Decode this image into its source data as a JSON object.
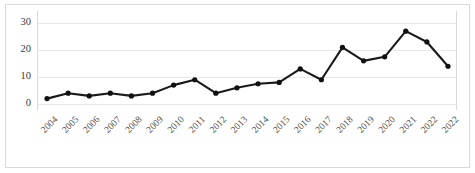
{
  "chart_data": {
    "type": "line",
    "title": "",
    "subtitle": "",
    "xlabel": "",
    "ylabel": "",
    "categories": [
      "2004",
      "2005",
      "2006",
      "2007",
      "2008",
      "2009",
      "2010",
      "2011",
      "2012",
      "2013",
      "2014",
      "2015",
      "2016",
      "2017",
      "2018",
      "2019",
      "2020",
      "2021",
      "2022",
      "2022"
    ],
    "values": [
      2,
      4,
      3,
      4,
      3,
      4,
      7,
      9,
      4,
      6,
      7.5,
      8,
      13,
      9,
      21,
      16,
      17.5,
      27,
      23,
      14
    ],
    "series": [
      {
        "name": "",
        "values": [
          2,
          4,
          3,
          4,
          3,
          4,
          7,
          9,
          4,
          6,
          7.5,
          8,
          13,
          9,
          21,
          16,
          17.5,
          27,
          23,
          14
        ]
      }
    ],
    "ylim": [
      0,
      33
    ],
    "xlim": [
      0,
      19
    ],
    "yticks": [
      0,
      10,
      20,
      30
    ],
    "ytick_labels": [
      "0",
      "10",
      "20",
      "30"
    ],
    "grid": "horizontal",
    "legend": "none",
    "marker": "circle",
    "line_color": "#1a1a1a",
    "marker_color": "#111111",
    "grid_color": "#e9e9e9",
    "frame_color": "#d9d9d9",
    "xtick_rotation": -45,
    "annotations": []
  },
  "figure": {
    "background_color": "#ffffff",
    "has_outer_border": true
  }
}
